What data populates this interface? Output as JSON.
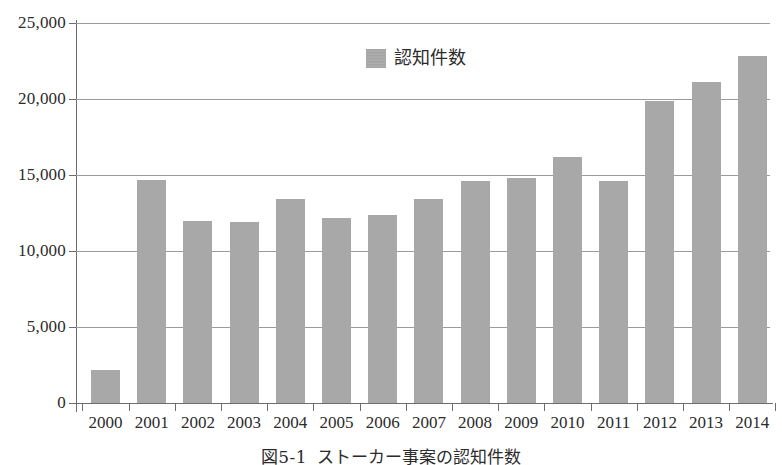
{
  "figure": {
    "caption_number": "図5-1",
    "caption_text": "ストーカー事案の認知件数"
  },
  "legend": {
    "position": "top-center",
    "entries": [
      {
        "label": "認知件数",
        "color": "#a8a8a8",
        "swatch_name": "legend-swatch-ninchikensuu"
      }
    ]
  },
  "colors": {
    "bar_fill": "#a8a8a8",
    "gridline": "#9b9b9b",
    "axis": "#6d6d6d",
    "text": "#2b2b2b",
    "background": "#ffffff"
  },
  "chart_data": {
    "type": "bar",
    "title": "ストーカー事案の認知件数",
    "xlabel": "",
    "ylabel": "",
    "ylim": [
      0,
      25000
    ],
    "ytick_values": [
      0,
      5000,
      10000,
      15000,
      20000,
      25000
    ],
    "ytick_labels": [
      "0",
      "5,000",
      "10,000",
      "15,000",
      "20,000",
      "25,000"
    ],
    "grid": true,
    "grid_axis": "y",
    "legend": "認知件数",
    "legend_position": "upper center",
    "categories": [
      "2000",
      "2001",
      "2002",
      "2003",
      "2004",
      "2005",
      "2006",
      "2007",
      "2008",
      "2009",
      "2010",
      "2011",
      "2012",
      "2013",
      "2014"
    ],
    "series": [
      {
        "name": "認知件数",
        "color": "#a8a8a8",
        "values": [
          2200,
          14700,
          12000,
          11900,
          13400,
          12200,
          12400,
          13400,
          14600,
          14800,
          16200,
          14600,
          19900,
          21100,
          22800
        ]
      }
    ]
  }
}
